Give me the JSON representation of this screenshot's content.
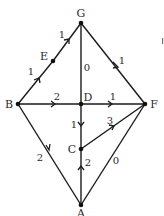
{
  "graph": {
    "nodes": [
      {
        "id": "G",
        "label": "G",
        "x": 81,
        "y": 23,
        "lx": 81,
        "ly": 16
      },
      {
        "id": "E",
        "label": "E",
        "x": 53,
        "y": 61,
        "lx": 44,
        "ly": 60
      },
      {
        "id": "B",
        "label": "B",
        "x": 18,
        "y": 104,
        "lx": 9,
        "ly": 108
      },
      {
        "id": "D",
        "label": "D",
        "x": 81,
        "y": 104,
        "lx": 88,
        "ly": 101
      },
      {
        "id": "F",
        "label": "F",
        "x": 145,
        "y": 104,
        "lx": 154,
        "ly": 108
      },
      {
        "id": "C",
        "label": "C",
        "x": 81,
        "y": 149,
        "lx": 72,
        "ly": 153
      },
      {
        "id": "A",
        "label": "A",
        "x": 81,
        "y": 205,
        "lx": 81,
        "ly": 216
      }
    ],
    "edges": [
      {
        "from": "B",
        "to": "E",
        "weight": "1",
        "directed": true,
        "wx": 31,
        "wy": 75
      },
      {
        "from": "E",
        "to": "G",
        "weight": "1",
        "directed": true,
        "wx": 62,
        "wy": 38
      },
      {
        "from": "G",
        "to": "F",
        "weight": "1",
        "directed": true,
        "wx": 122,
        "wy": 64
      },
      {
        "from": "G",
        "to": "D",
        "weight": "0",
        "directed": false,
        "wx": 87,
        "wy": 70
      },
      {
        "from": "B",
        "to": "D",
        "weight": "2",
        "directed": true,
        "wx": 56,
        "wy": 100
      },
      {
        "from": "D",
        "to": "F",
        "weight": "1",
        "directed": true,
        "wx": 113,
        "wy": 100
      },
      {
        "from": "D",
        "to": "C",
        "weight": "1",
        "directed": true,
        "wx": 74,
        "wy": 128
      },
      {
        "from": "C",
        "to": "F",
        "weight": "3",
        "directed": true,
        "wx": 110,
        "wy": 124
      },
      {
        "from": "B",
        "to": "A",
        "weight": "2",
        "directed": true,
        "wx": 40,
        "wy": 161
      },
      {
        "from": "A",
        "to": "C",
        "weight": "2",
        "directed": true,
        "wx": 88,
        "wy": 166
      },
      {
        "from": "A",
        "to": "F",
        "weight": "0",
        "directed": false,
        "wx": 116,
        "wy": 164
      }
    ]
  },
  "labels": {
    "G": "G",
    "E": "E",
    "B": "B",
    "D": "D",
    "F": "F",
    "C": "C",
    "A": "A",
    "w_BE": "1",
    "w_EG": "1",
    "w_GF": "1",
    "w_GD": "0",
    "w_BD": "2",
    "w_DF": "1",
    "w_DC": "1",
    "w_CF": "3",
    "w_BA": "2",
    "w_AC": "2",
    "w_AF": "0"
  }
}
